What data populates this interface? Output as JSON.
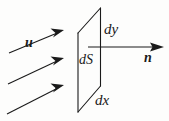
{
  "figure": {
    "type": "diagram",
    "background_color": "#fdfdfc",
    "stroke_color": "#1a1a1a"
  },
  "labels": {
    "velocity": "u",
    "normal": "n",
    "area_element": "dS",
    "width_element": "dx",
    "height_element": "dy"
  },
  "surface_element": {
    "name": "dS",
    "shape": "parallelogram",
    "corners": [
      {
        "x": 100.5,
        "y": 8
      },
      {
        "x": 100.5,
        "y": 86
      },
      {
        "x": 78,
        "y": 112
      },
      {
        "x": 78,
        "y": 33
      }
    ]
  },
  "normal_vector": {
    "label": "n",
    "start": {
      "x": 88,
      "y": 47
    },
    "end": {
      "x": 164,
      "y": 47
    },
    "direction": "right",
    "arrowhead": "solid-filled"
  },
  "flow_vectors": {
    "label": "u",
    "count": 3,
    "direction": "up-right",
    "arrowhead": "solid-filled",
    "arrows": [
      {
        "start": {
          "x": 9,
          "y": 53
        },
        "end": {
          "x": 64,
          "y": 30
        }
      },
      {
        "start": {
          "x": 8,
          "y": 84
        },
        "end": {
          "x": 64,
          "y": 58
        }
      },
      {
        "start": {
          "x": 7,
          "y": 114
        },
        "end": {
          "x": 64,
          "y": 85
        }
      }
    ]
  }
}
